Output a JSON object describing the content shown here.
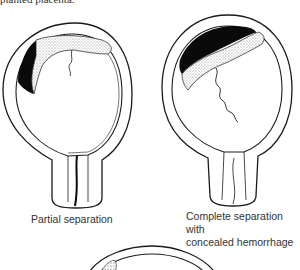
{
  "header": {
    "cutoff_text": "planted placenta."
  },
  "figures": [
    {
      "id": "partial",
      "caption": "Partial separation"
    },
    {
      "id": "complete",
      "caption_line1": "Complete separation with",
      "caption_line2": "concealed hemorrhage"
    },
    {
      "id": "third",
      "caption": ""
    }
  ],
  "colors": {
    "outline": "#1a1a1a",
    "hemorrhage": "#0a0a0a",
    "placenta_stipple": "#cfcfcf"
  }
}
